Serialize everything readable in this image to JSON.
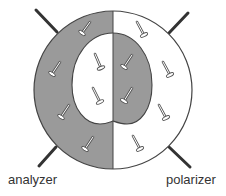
{
  "diagram": {
    "labels": {
      "analyzer": "analyzer",
      "polarizer": "polarizer"
    },
    "colors": {
      "dark_domain": "#9a9a9a",
      "bright_domain": "#ffffff",
      "outline": "#444444",
      "polarizer_line": "#333333",
      "text": "#333333"
    },
    "outer_circle": {
      "cx": 113,
      "cy": 90,
      "r": 79
    },
    "polarizer_lines": [
      {
        "x1": 36,
        "y1": 10,
        "x2": 57,
        "y2": 32
      },
      {
        "x1": 188,
        "y1": 13,
        "x2": 169,
        "y2": 33
      },
      {
        "x1": 56,
        "y1": 147,
        "x2": 39,
        "y2": 166
      },
      {
        "x1": 169,
        "y1": 147,
        "x2": 190,
        "y2": 167
      }
    ],
    "molecules": [
      {
        "region": "outer-left-dark",
        "x1": 90,
        "y1": 22,
        "x2": 82,
        "y2": 33
      },
      {
        "region": "outer-left-dark",
        "x1": 60,
        "y1": 62,
        "x2": 52,
        "y2": 74
      },
      {
        "region": "outer-left-dark",
        "x1": 69,
        "y1": 105,
        "x2": 61,
        "y2": 117
      },
      {
        "region": "outer-left-dark",
        "x1": 93,
        "y1": 137,
        "x2": 85,
        "y2": 149
      },
      {
        "region": "inner-left-bright",
        "x1": 95,
        "y1": 54,
        "x2": 101,
        "y2": 68
      },
      {
        "region": "inner-left-bright",
        "x1": 93,
        "y1": 88,
        "x2": 100,
        "y2": 102
      },
      {
        "region": "inner-right-dark",
        "x1": 132,
        "y1": 55,
        "x2": 124,
        "y2": 67
      },
      {
        "region": "inner-right-dark",
        "x1": 132,
        "y1": 88,
        "x2": 124,
        "y2": 101
      },
      {
        "region": "outer-right-bright",
        "x1": 137,
        "y1": 22,
        "x2": 144,
        "y2": 35
      },
      {
        "region": "outer-right-bright",
        "x1": 163,
        "y1": 62,
        "x2": 170,
        "y2": 75
      },
      {
        "region": "outer-right-bright",
        "x1": 159,
        "y1": 105,
        "x2": 166,
        "y2": 118
      },
      {
        "region": "outer-right-bright",
        "x1": 133,
        "y1": 136,
        "x2": 140,
        "y2": 149
      }
    ]
  }
}
